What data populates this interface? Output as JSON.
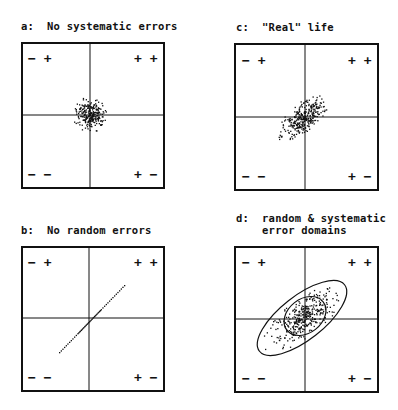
{
  "panels": [
    {
      "id": "a",
      "title": "a:  No systematic errors",
      "quadrants": {
        "top_left": "− +",
        "top_right": "+ +",
        "bottom_left": "− −",
        "bottom_right": "+ −"
      },
      "distribution": "round random scatter centered on origin"
    },
    {
      "id": "b",
      "title": "b:  No random errors",
      "quadrants": {
        "top_left": "− +",
        "top_right": "+ +",
        "bottom_left": "− −",
        "bottom_right": "+ −"
      },
      "distribution": "points along a diagonal line through origin (−− to ++)"
    },
    {
      "id": "c",
      "title": "c:  \"Real\" life",
      "quadrants": {
        "top_left": "− +",
        "top_right": "+ +",
        "bottom_left": "− −",
        "bottom_right": "+ −"
      },
      "distribution": "elongated scatter along the −−/++ diagonal"
    },
    {
      "id": "d",
      "title_line1": "d:  random & systematic",
      "title_line2": "    error domains",
      "quadrants": {
        "top_left": "− +",
        "top_right": "+ +",
        "bottom_left": "− −",
        "bottom_right": "+ −"
      },
      "distribution": "elongated scatter enclosed by an outer ellipse (systematic domain) and an inner ellipse (random domain)"
    }
  ],
  "colors": {
    "ink": "#111111",
    "background": "#ffffff"
  }
}
